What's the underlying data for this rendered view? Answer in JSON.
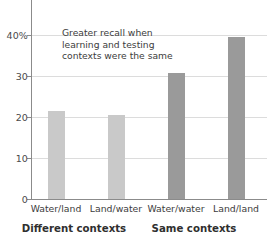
{
  "chart_data": {
    "type": "bar",
    "title": "",
    "xlabel": "",
    "ylabel": "",
    "categories": [
      "Water/land",
      "Land/water",
      "Water/water",
      "Land/land"
    ],
    "values": [
      21.5,
      20.6,
      30.7,
      39.5
    ],
    "series": [
      {
        "name": "Percent recall",
        "values": [
          21.5,
          20.6,
          30.7,
          39.5
        ]
      }
    ],
    "groups": [
      {
        "label": "Different contexts",
        "categories": [
          "Water/land",
          "Land/water"
        ],
        "color": "#c9c9c9"
      },
      {
        "label": "Same contexts",
        "categories": [
          "Water/water",
          "Land/land"
        ],
        "color": "#9a9a9a"
      }
    ],
    "ylim": [
      0,
      41
    ],
    "yticks": [
      0,
      10,
      20,
      30,
      40
    ],
    "ytick_labels": [
      "0",
      "10",
      "20",
      "30",
      "40%"
    ],
    "grid": true,
    "legend": "none",
    "annotations": [
      {
        "text_lines": [
          "Greater recall when",
          "learning and testing",
          "contexts were the same"
        ]
      }
    ],
    "colors": {
      "bar_light": "#c9c9c9",
      "bar_dark": "#9a9a9a",
      "gridline": "#dcdcdc",
      "axis": "#8b8b8b",
      "text": "#3c3c3c"
    }
  }
}
